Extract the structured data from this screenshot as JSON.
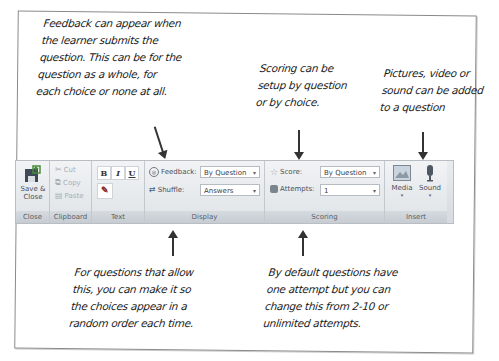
{
  "annotations": {
    "feedback": [
      "Feedback can appear when",
      "the learner submits the",
      "question. This can be for the",
      "question as a whole, for",
      "each choice or none at all."
    ],
    "scoring": [
      "Scoring can be",
      "setup by question",
      "or by choice."
    ],
    "insert": [
      "Pictures, video or",
      "sound can be added",
      "to a question"
    ],
    "shuffle": [
      "For questions that allow",
      "this, you can make it so",
      "the choices appear in a",
      "random order each time."
    ],
    "attempts": [
      "By default questions have",
      "one attempt but you can",
      "change this from 2-10 or",
      "unlimited attempts."
    ]
  },
  "ribbon": {
    "close_group": {
      "label": "Close",
      "save_close": "Save &\nClose",
      "save_close_line1": "Save &",
      "save_close_line2": "Close"
    },
    "clipboard_group": {
      "label": "Clipboard",
      "cut": "Cut",
      "copy": "Copy",
      "paste": "Paste"
    },
    "text_group": {
      "label": "Text",
      "bold": "B",
      "italic": "I",
      "underline": "U"
    },
    "display_group": {
      "label": "Display",
      "feedback_label": "Feedback:",
      "feedback_value": "By Question",
      "shuffle_label": "Shuffle:",
      "shuffle_value": "Answers"
    },
    "scoring_group": {
      "label": "Scoring",
      "score_label": "Score:",
      "score_value": "By Question",
      "attempts_label": "Attempts:",
      "attempts_value": "1"
    },
    "insert_group": {
      "label": "Insert",
      "media": "Media",
      "sound": "Sound"
    }
  }
}
